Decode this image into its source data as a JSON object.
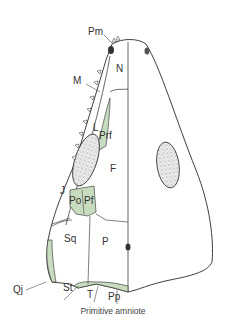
{
  "caption": "Primitive amniote",
  "colors": {
    "outline": "#2a2a2a",
    "shaded_bone": "#c8dcc0",
    "fenestra_fill": "#d9d9d9",
    "background": "#ffffff"
  },
  "labels": {
    "Pm": "Pm",
    "M": "M",
    "N": "N",
    "L": "L",
    "Prf": "Prf",
    "F": "F",
    "J": "J",
    "Po": "Po",
    "Pf": "Pf",
    "Sq": "Sq",
    "P": "P",
    "Qj": "Qj",
    "St": "St",
    "T": "T",
    "Pp": "Pp"
  }
}
